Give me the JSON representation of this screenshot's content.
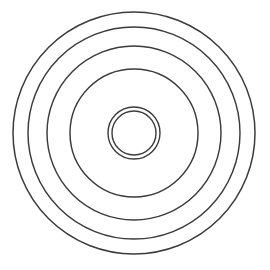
{
  "figure": {
    "caption_fragment": "",
    "background_color": "#ffffff",
    "stroke_color": "#3b3b3b",
    "center_x": 134,
    "center_y": 133,
    "ring_count": 6
  },
  "chart_data": {
    "type": "scatter",
    "subtitle": "",
    "xlabel": "",
    "ylabel": "",
    "xlim": [
      0,
      270
    ],
    "ylim": [
      0,
      270
    ],
    "grid": false,
    "legend": "none",
    "annotations": [],
    "center": [
      134,
      133
    ],
    "units": "px",
    "series": [
      {
        "name": "outer-rim-outer-edge",
        "shape": "circle",
        "radius": 121,
        "stroke": "#3b3b3b",
        "stroke_width": 1.5,
        "fill": "none"
      },
      {
        "name": "outer-rim-inner-edge",
        "shape": "circle",
        "radius": 106,
        "stroke": "#3b3b3b",
        "stroke_width": 1.45,
        "fill": "none"
      },
      {
        "name": "mid-ring-outer",
        "shape": "circle",
        "radius": 87,
        "stroke": "#3b3b3b",
        "stroke_width": 1.45,
        "fill": "none"
      },
      {
        "name": "mid-ring-inner",
        "shape": "circle",
        "radius": 64,
        "stroke": "#3b3b3b",
        "stroke_width": 1.45,
        "fill": "none"
      },
      {
        "name": "hub-outer",
        "shape": "circle",
        "radius": 26,
        "stroke": "#3b3b3b",
        "stroke_width": 1.4,
        "fill": "none"
      },
      {
        "name": "hub-inner",
        "shape": "circle",
        "radius": 22,
        "stroke": "#3b3b3b",
        "stroke_width": 1.4,
        "fill": "none"
      }
    ],
    "radii": [
      121,
      106,
      87,
      64,
      26,
      22
    ]
  }
}
